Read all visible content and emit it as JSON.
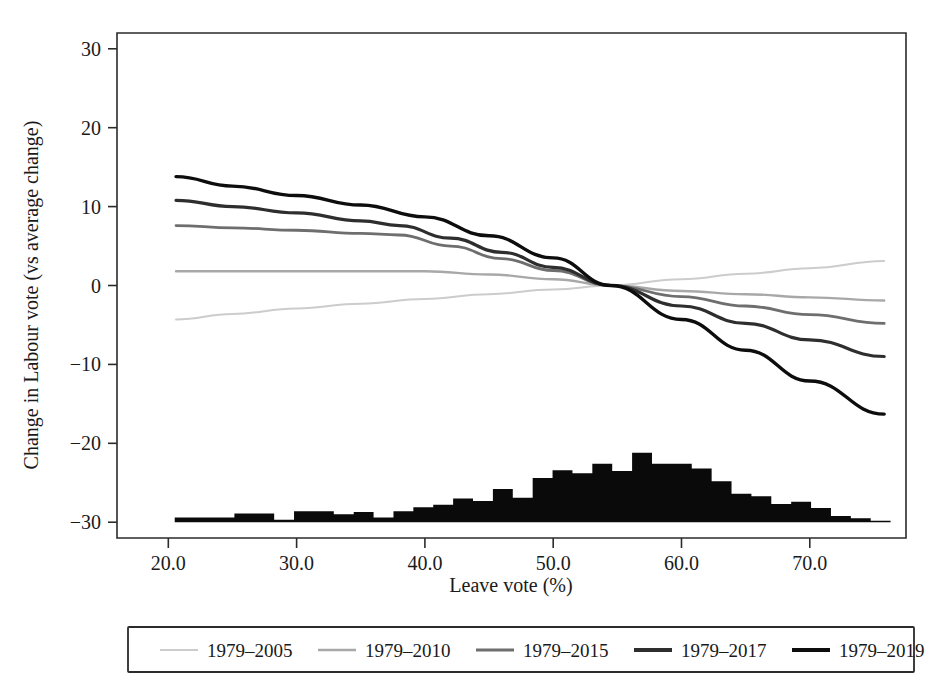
{
  "chart_data": {
    "type": "line",
    "title": "",
    "xlabel": "Leave vote (%)",
    "ylabel": "Change in Labour vote (vs average change)",
    "xlim": [
      16.0,
      77.5
    ],
    "ylim": [
      -32.0,
      32.0
    ],
    "xticks": [
      20.0,
      30.0,
      40.0,
      50.0,
      60.0,
      70.0
    ],
    "xtick_labels": [
      "20.0",
      "30.0",
      "40.0",
      "50.0",
      "60.0",
      "70.0"
    ],
    "yticks": [
      -30,
      -20,
      -10,
      0,
      10,
      20,
      30
    ],
    "ytick_labels": [
      "−30",
      "−20",
      "−10",
      "0",
      "10",
      "20",
      "30"
    ],
    "grid": false,
    "legend_position": "below-axes",
    "series": [
      {
        "name": "1979–2005",
        "color": "#cccccc",
        "width": 2.0,
        "x": [
          20.6,
          25.0,
          30.0,
          35.0,
          40.0,
          45.0,
          50.0,
          54.5,
          60.0,
          65.0,
          70.0,
          75.8
        ],
        "y": [
          -4.3,
          -3.6,
          -2.9,
          -2.3,
          -1.7,
          -1.1,
          -0.5,
          0.0,
          0.8,
          1.5,
          2.2,
          3.1
        ]
      },
      {
        "name": "1979–2010",
        "color": "#a8a8a8",
        "width": 2.4,
        "x": [
          20.6,
          25.0,
          30.0,
          35.0,
          40.0,
          45.0,
          50.0,
          54.5,
          60.0,
          65.0,
          70.0,
          75.8
        ],
        "y": [
          1.8,
          1.8,
          1.8,
          1.8,
          1.8,
          1.4,
          0.8,
          0.0,
          -0.7,
          -1.1,
          -1.5,
          -1.9
        ]
      },
      {
        "name": "1979–2015",
        "color": "#6e6e6e",
        "width": 2.8,
        "x": [
          20.6,
          25.0,
          30.0,
          35.0,
          38.0,
          42.0,
          46.0,
          50.0,
          54.5,
          60.0,
          65.0,
          70.0,
          75.8
        ],
        "y": [
          7.6,
          7.3,
          7.0,
          6.6,
          6.4,
          5.0,
          3.4,
          1.9,
          0.0,
          -1.4,
          -2.6,
          -3.7,
          -4.8
        ]
      },
      {
        "name": "1979–2017",
        "color": "#2e2e2e",
        "width": 3.2,
        "x": [
          20.6,
          25.0,
          30.0,
          35.0,
          38.0,
          42.0,
          46.0,
          50.0,
          54.5,
          60.0,
          65.0,
          70.0,
          75.8
        ],
        "y": [
          10.8,
          10.0,
          9.2,
          8.2,
          7.6,
          6.0,
          4.2,
          2.3,
          0.0,
          -2.6,
          -4.8,
          -6.9,
          -9.0
        ]
      },
      {
        "name": "1979–2019",
        "color": "#0d0d0d",
        "width": 3.4,
        "x": [
          20.6,
          25.0,
          30.0,
          35.0,
          40.0,
          45.0,
          50.0,
          54.5,
          60.0,
          65.0,
          70.0,
          75.8
        ],
        "y": [
          13.8,
          12.6,
          11.4,
          10.2,
          8.7,
          6.3,
          3.5,
          0.0,
          -4.3,
          -8.2,
          -12.1,
          -16.3
        ]
      }
    ],
    "histogram": {
      "name": "Leave vote distribution",
      "baseline": -30.0,
      "color": "#0a0a0a",
      "bin_width": 1.55,
      "bins_start": 20.5,
      "bin_lefts": [
        20.5,
        22.05,
        23.6,
        25.15,
        26.7,
        28.25,
        29.8,
        31.35,
        32.9,
        34.45,
        36.0,
        37.55,
        39.1,
        40.65,
        42.2,
        43.75,
        45.3,
        46.85,
        48.4,
        49.95,
        51.5,
        53.05,
        54.6,
        56.15,
        57.7,
        59.25,
        60.8,
        62.35,
        63.9,
        65.45,
        67.0,
        68.55,
        70.1,
        71.65,
        73.2,
        74.75
      ],
      "counts": [
        0.6,
        0.6,
        0.6,
        1.1,
        1.1,
        0.3,
        1.4,
        1.4,
        1.0,
        1.3,
        0.6,
        1.4,
        1.9,
        2.2,
        3.0,
        2.7,
        4.2,
        3.1,
        5.6,
        6.6,
        6.2,
        7.4,
        6.5,
        8.8,
        7.4,
        7.4,
        6.8,
        5.2,
        3.6,
        3.3,
        2.3,
        2.6,
        1.8,
        0.8,
        0.5,
        0.2
      ]
    }
  },
  "axes": {
    "y_title": "Change in Labour vote (vs average change)",
    "x_title": "Leave vote (%)",
    "x_tick_labels": [
      "20.0",
      "30.0",
      "40.0",
      "50.0",
      "60.0",
      "70.0"
    ],
    "y_tick_labels": [
      "30",
      "20",
      "10",
      "0",
      "−10",
      "−20",
      "−30"
    ]
  },
  "legend": {
    "entries": [
      {
        "label": "1979–2005",
        "color": "#cccccc",
        "width": 2.0
      },
      {
        "label": "1979–2010",
        "color": "#a8a8a8",
        "width": 2.6
      },
      {
        "label": "1979–2015",
        "color": "#6e6e6e",
        "width": 3.2
      },
      {
        "label": "1979–2017",
        "color": "#2e2e2e",
        "width": 3.8
      },
      {
        "label": "1979–2019",
        "color": "#0d0d0d",
        "width": 4.0
      }
    ]
  }
}
